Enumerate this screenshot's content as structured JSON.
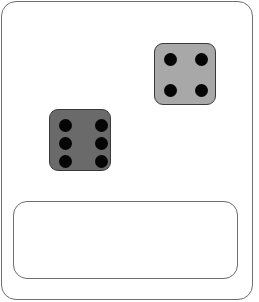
{
  "scene": {
    "frame_color": "#6e6e6e",
    "background": "#ffffff"
  },
  "dice": [
    {
      "name": "die-four",
      "value": 4,
      "face_color": "#a8a8a8",
      "x": 154,
      "y": 43,
      "size": 62,
      "pips": [
        [
          9,
          9
        ],
        [
          40,
          9
        ],
        [
          9,
          40
        ],
        [
          40,
          40
        ]
      ]
    },
    {
      "name": "die-six",
      "value": 6,
      "face_color": "#6a6a6a",
      "x": 49,
      "y": 109,
      "size": 62,
      "pips": [
        [
          9,
          9
        ],
        [
          45,
          9
        ],
        [
          9,
          27
        ],
        [
          45,
          27
        ],
        [
          9,
          45
        ],
        [
          45,
          45
        ]
      ]
    }
  ],
  "answer_box": {
    "value": ""
  }
}
